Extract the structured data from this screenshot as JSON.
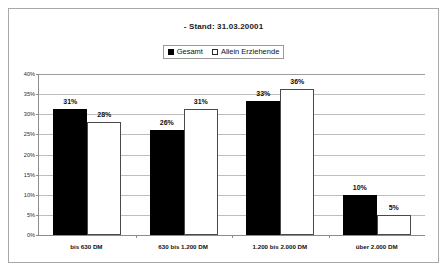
{
  "chart_data": {
    "type": "bar",
    "title": "- Stand: 31.03.20001",
    "xlabel": "",
    "ylabel": "",
    "ylim": [
      0,
      40
    ],
    "grid": true,
    "legend_position": "top-center",
    "categories": [
      "bis 630 DM",
      "630 bis 1.200 DM",
      "1.200 bis 2.000 DM",
      "über 2.000 DM"
    ],
    "ytick_labels": [
      "0%",
      "5%",
      "10%",
      "15%",
      "20%",
      "25%",
      "30%",
      "35%",
      "40%"
    ],
    "ytick_values": [
      0,
      5,
      10,
      15,
      20,
      25,
      30,
      35,
      40
    ],
    "series": [
      {
        "name": "Gesamt",
        "color": "#000000",
        "style": "filled",
        "values": [
          31,
          26,
          33,
          10
        ],
        "labels": [
          "31%",
          "26%",
          "33%",
          "10%"
        ]
      },
      {
        "name": "Allein Erziehende",
        "color": "#ffffff",
        "style": "hollow",
        "values": [
          28,
          31,
          36,
          5
        ],
        "labels": [
          "28%",
          "31%",
          "36%",
          "5%"
        ]
      }
    ]
  },
  "legend": {
    "items": [
      {
        "label": "Gesamt",
        "swatch": "filled-square-icon"
      },
      {
        "label": "Allein Erziehende",
        "swatch": "hollow-square-icon"
      }
    ]
  }
}
